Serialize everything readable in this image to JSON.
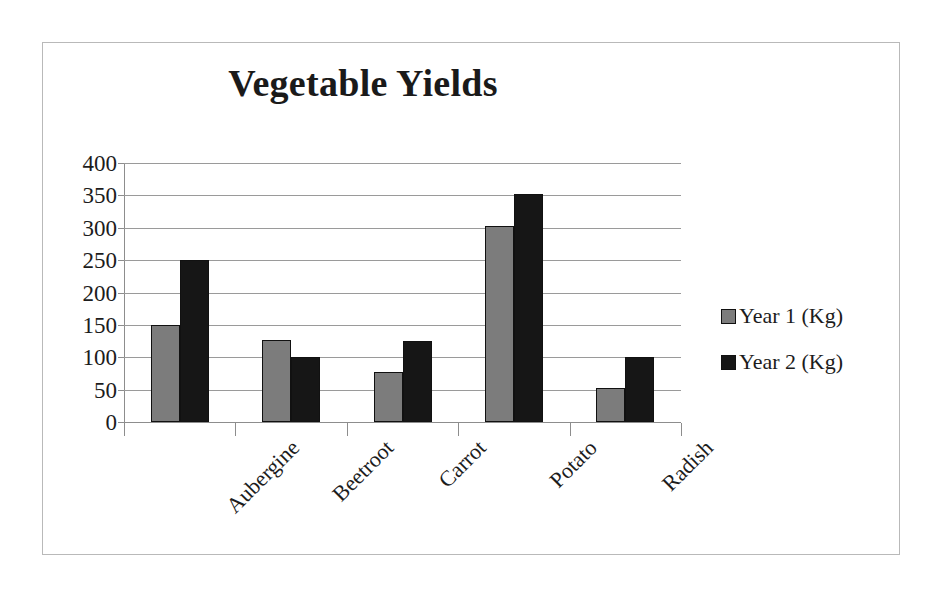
{
  "chart_data": {
    "type": "bar",
    "title": "Vegetable Yields",
    "xlabel": "",
    "ylabel": "",
    "ylim": [
      0,
      400
    ],
    "ytick_step": 50,
    "yticks": [
      "400",
      "350",
      "300",
      "250",
      "200",
      "150",
      "100",
      "50",
      "0"
    ],
    "grid": true,
    "legend_position": "right",
    "categories": [
      "Aubergine",
      "Beetroot",
      "Carrot",
      "Potato",
      "Radish"
    ],
    "series": [
      {
        "name": "Year 1 (Kg)",
        "color": "#7c7c7c",
        "values": [
          150,
          127,
          77,
          302,
          53
        ]
      },
      {
        "name": "Year 2 (Kg)",
        "color": "#161616",
        "values": [
          250,
          100,
          125,
          352,
          101
        ]
      }
    ]
  },
  "frame": {
    "border_color": "#b9b9b9"
  },
  "axis": {
    "line_color": "#8d8d8d",
    "grid_color": "#9a9a9a"
  }
}
